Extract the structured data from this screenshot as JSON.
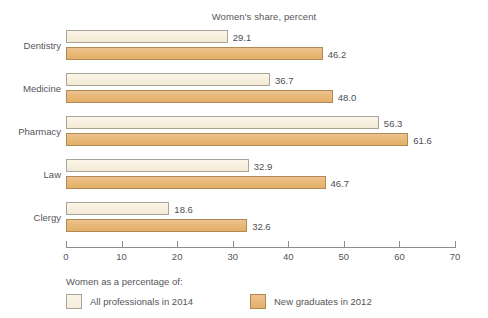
{
  "chart_data": {
    "type": "bar",
    "orientation": "horizontal",
    "title": "Women's share, percent",
    "xlabel": "",
    "ylabel": "",
    "xlim": [
      0,
      70
    ],
    "xticks": [
      "0",
      "10",
      "20",
      "30",
      "40",
      "50",
      "60",
      "70"
    ],
    "grid": false,
    "legend_position": "bottom-left",
    "legend_title": "Women as a percentage of:",
    "categories": [
      "Dentistry",
      "Medicine",
      "Pharmacy",
      "Law",
      "Clergy"
    ],
    "series": [
      {
        "name": "All professionals in 2014",
        "color": "#f6eddb",
        "values": [
          29.1,
          36.7,
          56.3,
          32.9,
          18.6
        ],
        "labels": [
          "29.1",
          "36.7",
          "56.3",
          "32.9",
          "18.6"
        ]
      },
      {
        "name": "New graduates in 2012",
        "color": "#e8b978",
        "values": [
          46.2,
          48.0,
          61.6,
          46.7,
          32.6
        ],
        "labels": [
          "46.2",
          "48.0",
          "61.6",
          "46.7",
          "32.6"
        ]
      }
    ]
  },
  "colors": {
    "series_light": "#f6eddb",
    "series_dark": "#e8b978",
    "axis": "#8d8d8d",
    "text": "#55555a",
    "background": "#ffffff"
  }
}
